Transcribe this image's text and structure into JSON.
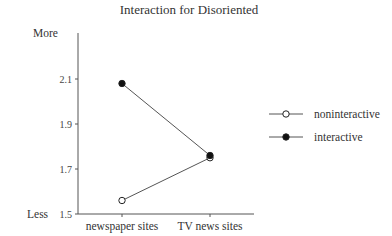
{
  "chart_data": {
    "type": "line",
    "title": "Interaction for Disoriented",
    "xlabel": "",
    "ylabel": "",
    "y_side_labels": {
      "top": "More",
      "bottom": "Less"
    },
    "categories": [
      "newspaper sites",
      "TV news sites"
    ],
    "ylim": [
      1.5,
      2.5
    ],
    "yticks": [
      "1.5",
      "1.7",
      "1.9",
      "2.1",
      "2.5"
    ],
    "grid": false,
    "legend_position": "right",
    "series": [
      {
        "name": "noninteractive",
        "marker": "open-circle",
        "values": [
          1.56,
          1.75
        ]
      },
      {
        "name": "interactive",
        "marker": "filled-circle",
        "values": [
          2.08,
          1.76
        ]
      }
    ]
  },
  "colors": {
    "line": "#555555",
    "marker_fill_interactive": "#111111",
    "marker_fill_noninteractive": "#ffffff"
  }
}
